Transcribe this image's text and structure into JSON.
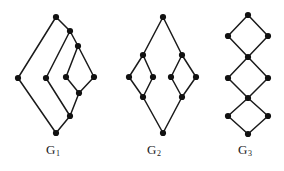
{
  "figure": {
    "width": 284,
    "height": 171,
    "background_color": "#ffffff",
    "stroke_color": "#1a1a1a",
    "node_color": "#111111",
    "node_radius": 3.1,
    "edge_width": 1.5
  },
  "labels": {
    "g1": {
      "text": "G",
      "subscript": "1"
    },
    "g2": {
      "text": "G",
      "subscript": "2"
    },
    "g3": {
      "text": "G",
      "subscript": "3"
    }
  },
  "graphs": [
    {
      "id": "G1",
      "label": "G1",
      "node_count": 10,
      "edge_count": 12,
      "description": "three nested diamonds sharing a common top and bottom vertex",
      "nodes": [
        {
          "id": "a",
          "x": 56,
          "y": 17
        },
        {
          "id": "b",
          "x": 70,
          "y": 31
        },
        {
          "id": "c",
          "x": 78,
          "y": 46
        },
        {
          "id": "d",
          "x": 18,
          "y": 78
        },
        {
          "id": "e",
          "x": 46,
          "y": 78
        },
        {
          "id": "f",
          "x": 66,
          "y": 77
        },
        {
          "id": "g",
          "x": 94,
          "y": 77
        },
        {
          "id": "h",
          "x": 79,
          "y": 93
        },
        {
          "id": "i",
          "x": 70,
          "y": 116
        },
        {
          "id": "j",
          "x": 56,
          "y": 133
        }
      ],
      "edges": [
        [
          "a",
          "d"
        ],
        [
          "a",
          "b"
        ],
        [
          "b",
          "e"
        ],
        [
          "b",
          "c"
        ],
        [
          "c",
          "f"
        ],
        [
          "c",
          "g"
        ],
        [
          "f",
          "h"
        ],
        [
          "g",
          "h"
        ],
        [
          "h",
          "i"
        ],
        [
          "e",
          "i"
        ],
        [
          "i",
          "j"
        ],
        [
          "d",
          "j"
        ]
      ]
    },
    {
      "id": "G2",
      "label": "G2",
      "node_count": 10,
      "edge_count": 12,
      "description": "top and bottom vertex joined through two side-by-side diamonds",
      "nodes": [
        {
          "id": "t",
          "x": 163,
          "y": 17
        },
        {
          "id": "lt",
          "x": 143,
          "y": 55
        },
        {
          "id": "ll",
          "x": 129,
          "y": 77
        },
        {
          "id": "lr",
          "x": 153,
          "y": 77
        },
        {
          "id": "lb",
          "x": 143,
          "y": 97
        },
        {
          "id": "rt",
          "x": 182,
          "y": 55
        },
        {
          "id": "rl",
          "x": 171,
          "y": 77
        },
        {
          "id": "rr",
          "x": 196,
          "y": 77
        },
        {
          "id": "rb",
          "x": 182,
          "y": 97
        },
        {
          "id": "b",
          "x": 163,
          "y": 133
        }
      ],
      "edges": [
        [
          "t",
          "lt"
        ],
        [
          "t",
          "rt"
        ],
        [
          "lt",
          "ll"
        ],
        [
          "lt",
          "lr"
        ],
        [
          "ll",
          "lb"
        ],
        [
          "lr",
          "lb"
        ],
        [
          "rt",
          "rl"
        ],
        [
          "rt",
          "rr"
        ],
        [
          "rl",
          "rb"
        ],
        [
          "rr",
          "rb"
        ],
        [
          "lb",
          "b"
        ],
        [
          "rb",
          "b"
        ]
      ]
    },
    {
      "id": "G3",
      "label": "G3",
      "node_count": 10,
      "edge_count": 12,
      "description": "vertical chain of three diamonds joined at shared cut vertices",
      "nodes": [
        {
          "id": "n1",
          "x": 248,
          "y": 15
        },
        {
          "id": "n2",
          "x": 228,
          "y": 36
        },
        {
          "id": "n3",
          "x": 268,
          "y": 36
        },
        {
          "id": "n4",
          "x": 248,
          "y": 57
        },
        {
          "id": "n5",
          "x": 228,
          "y": 78
        },
        {
          "id": "n6",
          "x": 268,
          "y": 78
        },
        {
          "id": "n7",
          "x": 248,
          "y": 98
        },
        {
          "id": "n8",
          "x": 228,
          "y": 116
        },
        {
          "id": "n9",
          "x": 268,
          "y": 116
        },
        {
          "id": "n10",
          "x": 248,
          "y": 134
        }
      ],
      "edges": [
        [
          "n1",
          "n2"
        ],
        [
          "n1",
          "n3"
        ],
        [
          "n2",
          "n4"
        ],
        [
          "n3",
          "n4"
        ],
        [
          "n4",
          "n5"
        ],
        [
          "n4",
          "n6"
        ],
        [
          "n5",
          "n7"
        ],
        [
          "n6",
          "n7"
        ],
        [
          "n7",
          "n8"
        ],
        [
          "n7",
          "n9"
        ],
        [
          "n8",
          "n10"
        ],
        [
          "n9",
          "n10"
        ]
      ]
    }
  ]
}
